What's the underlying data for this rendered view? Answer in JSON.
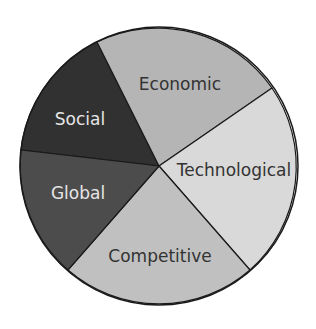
{
  "diagram": {
    "type": "pie",
    "segments": [
      {
        "label": "Social",
        "color": "#313131",
        "text_color": "#e6e6e6"
      },
      {
        "label": "Economic",
        "color": "#b5b5b5",
        "text_color": "#333333"
      },
      {
        "label": "Technological",
        "color": "#d9d9d9",
        "text_color": "#333333"
      },
      {
        "label": "Competitive",
        "color": "#c0c0c0",
        "text_color": "#333333"
      },
      {
        "label": "Global",
        "color": "#4c4c4c",
        "text_color": "#e6e6e6"
      }
    ],
    "stroke_color": "#1a1a1a"
  }
}
